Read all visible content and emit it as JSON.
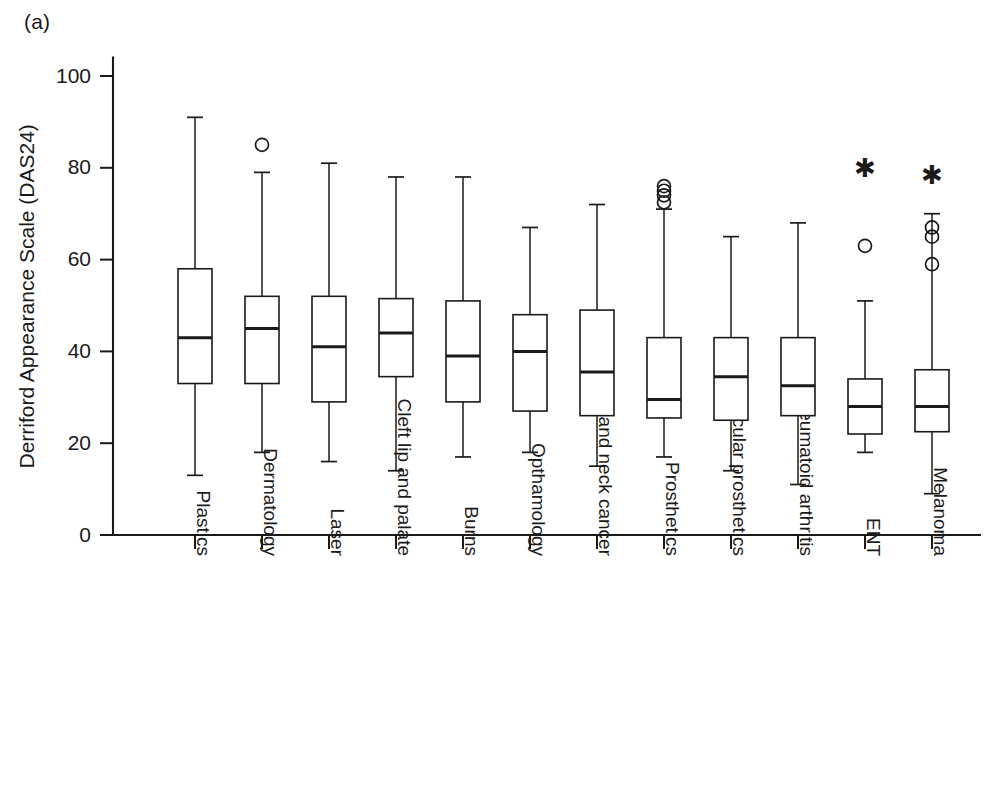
{
  "panel": {
    "label": "(a)"
  },
  "chart_data": {
    "type": "box",
    "title": "",
    "subtitle": "",
    "xlabel": "",
    "ylabel": "Derriford Appearance Scale (DAS24)",
    "ylim": [
      0,
      104
    ],
    "yticks": [
      0,
      20,
      40,
      60,
      80,
      100
    ],
    "ytick_labels": [
      "0",
      "20",
      "40",
      "60",
      "80",
      "100"
    ],
    "grid": false,
    "legend": null,
    "categories": [
      "Plastics",
      "Dermatology",
      "Laser",
      "Cleft lip and palate",
      "Burns",
      "Opthamology",
      "Head and neck cancer",
      "Prosthetics",
      "Ocular prosthetics",
      "Rheumatoid arthritis",
      "ENT",
      "Melanoma"
    ],
    "boxes": [
      {
        "category": "Plastics",
        "whisker_low": 13,
        "q1": 33,
        "median": 43,
        "q3": 58,
        "whisker_high": 91,
        "outliers": [],
        "extremes": []
      },
      {
        "category": "Dermatology",
        "whisker_low": 18,
        "q1": 33,
        "median": 45,
        "q3": 52,
        "whisker_high": 79,
        "outliers": [
          85
        ],
        "extremes": []
      },
      {
        "category": "Laser",
        "whisker_low": 16,
        "q1": 29,
        "median": 41,
        "q3": 52,
        "whisker_high": 81,
        "outliers": [],
        "extremes": []
      },
      {
        "category": "Cleft lip and palate",
        "whisker_low": 14,
        "q1": 34.5,
        "median": 44,
        "q3": 51.5,
        "whisker_high": 78,
        "outliers": [],
        "extremes": []
      },
      {
        "category": "Burns",
        "whisker_low": 17,
        "q1": 29,
        "median": 39,
        "q3": 51,
        "whisker_high": 78,
        "outliers": [],
        "extremes": []
      },
      {
        "category": "Opthamology",
        "whisker_low": 18,
        "q1": 27,
        "median": 40,
        "q3": 48,
        "whisker_high": 67,
        "outliers": [],
        "extremes": []
      },
      {
        "category": "Head and neck cancer",
        "whisker_low": 15,
        "q1": 26,
        "median": 35.5,
        "q3": 49,
        "whisker_high": 72,
        "outliers": [],
        "extremes": []
      },
      {
        "category": "Prosthetics",
        "whisker_low": 17,
        "q1": 25.5,
        "median": 29.5,
        "q3": 43,
        "whisker_high": 71,
        "outliers": [
          76,
          75,
          74,
          72.5
        ],
        "extremes": []
      },
      {
        "category": "Ocular prosthetics",
        "whisker_low": 14,
        "q1": 25,
        "median": 34.5,
        "q3": 43,
        "whisker_high": 65,
        "outliers": [],
        "extremes": []
      },
      {
        "category": "Rheumatoid arthritis",
        "whisker_low": 11,
        "q1": 26,
        "median": 32.5,
        "q3": 43,
        "whisker_high": 68,
        "outliers": [],
        "extremes": []
      },
      {
        "category": "ENT",
        "whisker_low": 18,
        "q1": 22,
        "median": 28,
        "q3": 34,
        "whisker_high": 51,
        "outliers": [
          63
        ],
        "extremes": [
          80
        ]
      },
      {
        "category": "Melanoma",
        "whisker_low": 9,
        "q1": 22.5,
        "median": 28,
        "q3": 36,
        "whisker_high": 70,
        "outliers": [
          67,
          65,
          59
        ],
        "extremes": [
          78.5
        ]
      }
    ]
  },
  "geometry": {
    "plot_left": 113,
    "plot_right": 980,
    "y_top_px": 76,
    "y_bottom_px": 535,
    "box_half_width": 17,
    "first_tick_x": 195,
    "tick_spacing": 67,
    "xlabel_start_y": 556
  }
}
